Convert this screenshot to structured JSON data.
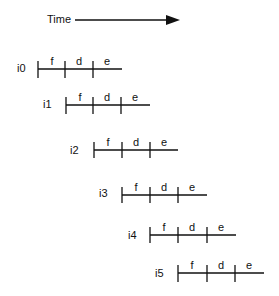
{
  "time_axis": {
    "label": "Time",
    "arrow": "right"
  },
  "pipeline": {
    "stage_labels": [
      "f",
      "d",
      "e"
    ],
    "instructions": [
      {
        "label": "i0",
        "stages": [
          "f",
          "d",
          "e"
        ]
      },
      {
        "label": "i1",
        "stages": [
          "f",
          "d",
          "e"
        ]
      },
      {
        "label": "i2",
        "stages": [
          "f",
          "d",
          "e"
        ]
      },
      {
        "label": "i3",
        "stages": [
          "f",
          "d",
          "e"
        ]
      },
      {
        "label": "i4",
        "stages": [
          "f",
          "d",
          "e"
        ]
      },
      {
        "label": "i5",
        "stages": [
          "f",
          "d",
          "e"
        ]
      }
    ]
  }
}
